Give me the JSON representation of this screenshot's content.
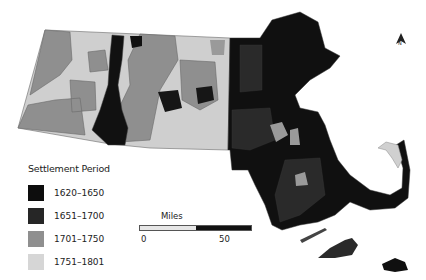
{
  "map": {
    "region": "Massachusetts",
    "type": "choropleth",
    "subject": "Town settlement period"
  },
  "legend": {
    "title": "Settlement Period",
    "items": [
      {
        "label": "1620–1650",
        "color": "#0d0d0d"
      },
      {
        "label": "1651–1700",
        "color": "#262626"
      },
      {
        "label": "1701–1750",
        "color": "#8f8f8f"
      },
      {
        "label": "1751–1801",
        "color": "#d6d6d6"
      }
    ]
  },
  "scale": {
    "title": "Miles",
    "start": "0",
    "end": "50",
    "colors": [
      "#e6e6e6",
      "#111111"
    ]
  },
  "north_arrow": {
    "label": "N"
  },
  "colors": {
    "period_1620_1650": "#0d0d0d",
    "period_1651_1700": "#262626",
    "period_1701_1750": "#8f8f8f",
    "period_1751_1801": "#d6d6d6",
    "border": "#6a6a6a"
  }
}
